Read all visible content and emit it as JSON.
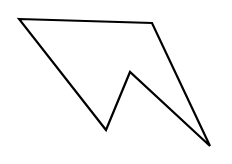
{
  "figure": {
    "width": 232,
    "height": 164,
    "background": "#ffffff",
    "shape": {
      "type": "polygon",
      "stroke": "#000000",
      "stroke_width": 2.2,
      "fill": "none",
      "vertices": [
        [
          19,
          19
        ],
        [
          152,
          23
        ],
        [
          210,
          146
        ],
        [
          130,
          72
        ],
        [
          106,
          130
        ]
      ]
    }
  }
}
